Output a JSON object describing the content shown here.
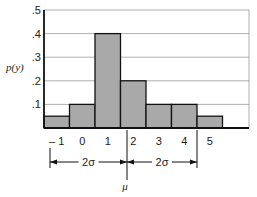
{
  "chart_data": {
    "type": "bar",
    "title": "",
    "xlabel": "",
    "ylabel": "p(y)",
    "categories": [
      "-1",
      "0",
      "1",
      "2",
      "3",
      "4",
      "5"
    ],
    "values": [
      0.05,
      0.1,
      0.4,
      0.2,
      0.1,
      0.1,
      0.05
    ],
    "ylim": [
      0,
      0.5
    ],
    "yticks": [
      ".1",
      ".2",
      ".3",
      ".4",
      ".5"
    ],
    "grid": true,
    "bar_color": "#a9a9a9",
    "annotations": {
      "mean_label": "μ",
      "left_span_label": "2σ",
      "right_span_label": "2σ",
      "mean_x": 1.6,
      "left_bound_x": -1,
      "right_bound_x": 4.6
    }
  }
}
